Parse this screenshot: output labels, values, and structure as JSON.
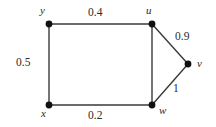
{
  "figure": {
    "kind": "weighted-undirected-graph",
    "width": 216,
    "height": 127,
    "background_color": "#ffffff",
    "line_color": "#3a3a3a",
    "node_color": "#111111",
    "text_color": "#2b2b2b"
  },
  "chart_data": {
    "type": "diagram",
    "title": "",
    "xlabel": "",
    "ylabel": "",
    "nodes": [
      {
        "id": "y",
        "label": "y",
        "x": 49,
        "y": 24,
        "label_x": 40,
        "label_y": 5,
        "radius": 3.4
      },
      {
        "id": "u",
        "label": "u",
        "x": 152,
        "y": 24,
        "label_x": 146,
        "label_y": 5,
        "radius": 3.4
      },
      {
        "id": "v",
        "label": "v",
        "x": 188,
        "y": 64,
        "label_x": 197,
        "label_y": 58,
        "radius": 3.4
      },
      {
        "id": "w",
        "label": "w",
        "x": 152,
        "y": 105,
        "label_x": 159,
        "label_y": 105,
        "radius": 3.4
      },
      {
        "id": "x",
        "label": "x",
        "x": 49,
        "y": 105,
        "label_x": 41,
        "label_y": 108,
        "radius": 3.4
      }
    ],
    "edges": [
      {
        "id": "y-u",
        "source": "y",
        "target": "u",
        "weight": "0.4",
        "label_x": 88,
        "label_y": 7
      },
      {
        "id": "y-x",
        "source": "y",
        "target": "x",
        "weight": "0.5",
        "label_x": 16,
        "label_y": 57
      },
      {
        "id": "x-w",
        "source": "x",
        "target": "w",
        "weight": "0.2",
        "label_x": 88,
        "label_y": 110
      },
      {
        "id": "u-w",
        "source": "u",
        "target": "w",
        "weight": "",
        "label_x": 0,
        "label_y": 0
      },
      {
        "id": "u-v",
        "source": "u",
        "target": "v",
        "weight": "0.9",
        "label_x": 175,
        "label_y": 31
      },
      {
        "id": "w-v",
        "source": "w",
        "target": "v",
        "weight": "1",
        "label_x": 173,
        "label_y": 83
      }
    ],
    "node_labels": [
      "y",
      "u",
      "v",
      "w",
      "x"
    ],
    "edge_weights": [
      "0.4",
      "0.5",
      "0.2",
      "0.9",
      "1"
    ],
    "legend": [],
    "annotations": []
  }
}
